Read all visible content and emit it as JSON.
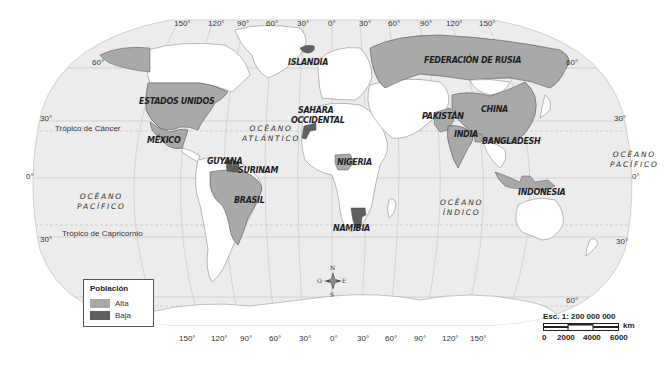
{
  "map": {
    "title": "Población",
    "projection": "Robinson-like world map",
    "colors": {
      "ocean": "#ececec",
      "land_default": "#ffffff",
      "alta": "#a9a9a9",
      "baja": "#5e5e5e",
      "graticule": "#c4c4c4",
      "border": "#555555"
    },
    "longitude_ticks_top": [
      "150°",
      "120°",
      "90°",
      "60°",
      "30°",
      "0°",
      "30°",
      "60°",
      "90°",
      "120°",
      "150°"
    ],
    "longitude_ticks_bottom": [
      "150°",
      "120°",
      "90°",
      "60°",
      "30°",
      "0°",
      "30°",
      "60°",
      "90°",
      "120°",
      "150°"
    ],
    "latitude_ticks": {
      "left": [
        "60°",
        "30°",
        "0°",
        "30°"
      ],
      "right": [
        "60°",
        "30°",
        "0°",
        "30°",
        "60°"
      ]
    },
    "lines": {
      "tropic_cancer": "Trópico de Cáncer",
      "tropic_capricorn": "Trópico de Capricornio"
    },
    "oceans": [
      {
        "name": "OCÉANO\nATLÁNTICO",
        "line1": "OCÉANO",
        "line2": "ATLÁNTICO"
      },
      {
        "name": "OCÉANO\nPACÍFICO (west)",
        "line1": "OCÉANO",
        "line2": "PACÍFICO"
      },
      {
        "name": "OCÉANO\nPACÍFICO (east)",
        "line1": "OCÉANO",
        "line2": "PACÍFICO"
      },
      {
        "name": "OCÉANO\nÍNDICO",
        "line1": "OCÉANO",
        "line2": "ÍNDICO"
      }
    ],
    "countries": {
      "alta": [
        "ESTADOS UNIDOS",
        "MÉXICO",
        "BRASIL",
        "NIGERIA",
        "FEDERACIÓN DE RUSIA",
        "CHINA",
        "PAKISTÁN",
        "INDIA",
        "BANGLADESH",
        "INDONESIA"
      ],
      "baja": [
        "ISLANDIA",
        "SAHARA OCCIDENTAL",
        "GUYANA",
        "SURINAM",
        "NAMIBIA"
      ]
    },
    "labels": {
      "usa": "ESTADOS UNIDOS",
      "mexico": "MÉXICO",
      "brasil": "BRASIL",
      "guyana": "GUYANA",
      "surinam": "SURINAM",
      "islandia": "ISLANDIA",
      "sahara1": "SAHARA",
      "sahara2": "OCCIDENTAL",
      "nigeria": "NIGERIA",
      "namibia": "NAMIBIA",
      "rusia": "FEDERACIÓN DE RUSIA",
      "china": "CHINA",
      "pakistan": "PAKISTÁN",
      "india": "INDIA",
      "bangladesh": "BANGLADESH",
      "indonesia": "INDONESIA"
    },
    "compass": {
      "n": "N",
      "s": "S",
      "e": "E",
      "w": "O"
    }
  },
  "legend": {
    "title": "Población",
    "items": [
      {
        "label": "Alta",
        "color": "#a9a9a9"
      },
      {
        "label": "Baja",
        "color": "#5e5e5e"
      }
    ]
  },
  "scale": {
    "text": "Esc. 1: 200 000 000",
    "unit": "km",
    "marks": [
      "0",
      "2000",
      "4000",
      "6000"
    ]
  }
}
